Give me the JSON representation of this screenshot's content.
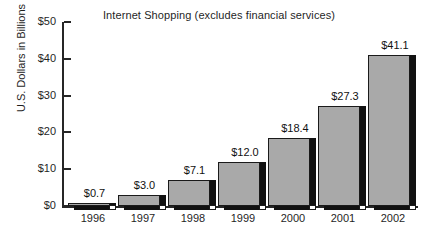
{
  "chart_data": {
    "type": "bar",
    "title": "Internet Shopping (excludes financial services)",
    "xlabel": "",
    "ylabel": "U.S. Dollars in Billions",
    "categories": [
      "1996",
      "1997",
      "1998",
      "1999",
      "2000",
      "2001",
      "2002"
    ],
    "values": [
      0.7,
      3.0,
      7.1,
      12.0,
      18.4,
      27.3,
      41.1
    ],
    "data_labels": [
      "$0.7",
      "$3.0",
      "$7.1",
      "$12.0",
      "$18.4",
      "$27.3",
      "$41.1"
    ],
    "ylim": [
      0,
      50
    ],
    "yticks": [
      0,
      10,
      20,
      30,
      40,
      50
    ],
    "ytick_labels": [
      "$0",
      "$10",
      "$20",
      "$30",
      "$40",
      "$50"
    ],
    "grid": false,
    "legend": false,
    "bar_color": "#a9a9a9",
    "shadow_color": "#111111",
    "axis_color": "#262626",
    "background": "#ffffff",
    "series": [
      {
        "name": "Internet Shopping",
        "values": [
          0.7,
          3.0,
          7.1,
          12.0,
          18.4,
          27.3,
          41.1
        ]
      }
    ]
  }
}
